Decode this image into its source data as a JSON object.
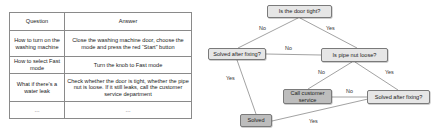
{
  "table": {
    "headers": [
      "Question",
      "Answer"
    ],
    "rows": [
      {
        "question": "How to turn on the washing machine",
        "answer": "Close the washing machine door, choose the mode and press the red “Start” button"
      },
      {
        "question": "How to select Fast mode",
        "answer": "Turn the knob to Fast mode"
      },
      {
        "question": "What if there’s a water leak",
        "answer": "Check whether the door is tight, whether the pipe nut is loose. If it still leaks, call the customer service department"
      },
      {
        "question": "…",
        "answer": "…"
      }
    ]
  },
  "flowchart": {
    "nodes": {
      "door_tight": "Is the door tight?",
      "solved_left": "Solved after fixing?",
      "pipe_nut": "Is pipe nut loose?",
      "call_service": "Call customer service",
      "solved_right": "Solved after fixing?",
      "solved": "Solved"
    },
    "edges": {
      "door_no": "No",
      "door_yes": "Yes",
      "left_no": "No",
      "left_yes": "Yes",
      "pipe_no": "No",
      "pipe_yes": "Yes",
      "right_no": "No",
      "right_yes": "Yes"
    },
    "colors": {
      "node_fill": "#e6e6e6",
      "terminal_fill": "#bdbdbd",
      "line": "#8a8a8a"
    }
  }
}
